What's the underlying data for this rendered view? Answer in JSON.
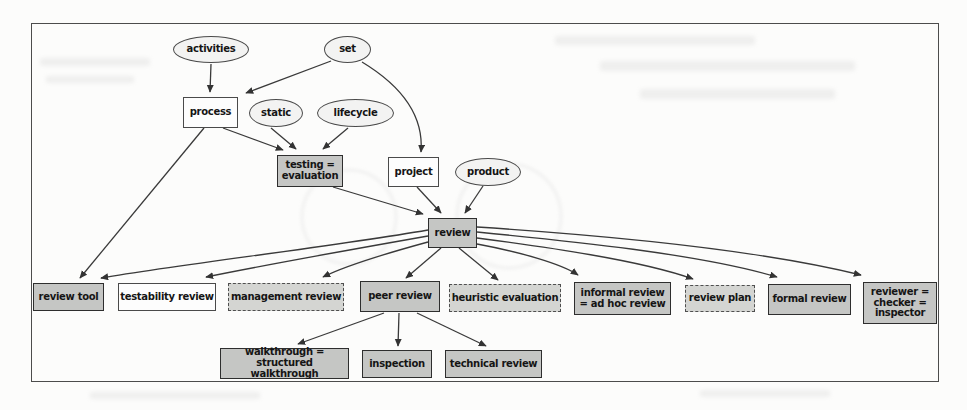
{
  "figure": {
    "colors": {
      "node_gray": "#c5c6c4",
      "node_gray_light": "#d4d5d2",
      "node_white": "#fdfdfd",
      "ellipse_fill": "#f3f3f2",
      "node_border": "#2e2e2e",
      "edge_line": "#3a3a3a"
    },
    "nodes": {
      "activities": {
        "label": "activities",
        "shape": "ellipse"
      },
      "set": {
        "label": "set",
        "shape": "ellipse"
      },
      "static": {
        "label": "static",
        "shape": "ellipse"
      },
      "lifecycle": {
        "label": "lifecycle",
        "shape": "ellipse"
      },
      "product": {
        "label": "product",
        "shape": "ellipse"
      },
      "process": {
        "label": "process",
        "shape": "rect-white"
      },
      "project": {
        "label": "project",
        "shape": "rect-white"
      },
      "testability_review": {
        "label": "testability review",
        "shape": "rect-white"
      },
      "testing_evaluation": {
        "label": "testing = evaluation",
        "shape": "rect-gray"
      },
      "review": {
        "label": "review",
        "shape": "rect-gray"
      },
      "review_tool": {
        "label": "review tool",
        "shape": "rect-gray"
      },
      "peer_review": {
        "label": "peer review",
        "shape": "rect-gray"
      },
      "informal_review": {
        "label": "informal review = ad hoc review",
        "shape": "rect-gray"
      },
      "formal_review": {
        "label": "formal review",
        "shape": "rect-gray"
      },
      "reviewer": {
        "label": "reviewer = checker = inspector",
        "shape": "rect-gray"
      },
      "walkthrough": {
        "label": "walkthrough = structured walkthrough",
        "shape": "rect-gray"
      },
      "inspection": {
        "label": "inspection",
        "shape": "rect-gray"
      },
      "technical_review": {
        "label": "technical review",
        "shape": "rect-gray"
      },
      "management_review": {
        "label": "management review",
        "shape": "rect-gray-dashed"
      },
      "heuristic_evaluation": {
        "label": "heuristic evaluation",
        "shape": "rect-gray-dashed"
      },
      "review_plan": {
        "label": "review plan",
        "shape": "rect-gray-dashed"
      }
    },
    "edges": [
      {
        "from": "activities",
        "to": "process"
      },
      {
        "from": "set",
        "to": "process"
      },
      {
        "from": "set",
        "to": "project"
      },
      {
        "from": "static",
        "to": "testing_evaluation"
      },
      {
        "from": "lifecycle",
        "to": "testing_evaluation"
      },
      {
        "from": "process",
        "to": "testing_evaluation"
      },
      {
        "from": "process",
        "to": "review_tool"
      },
      {
        "from": "testing_evaluation",
        "to": "review"
      },
      {
        "from": "project",
        "to": "review"
      },
      {
        "from": "product",
        "to": "review"
      },
      {
        "from": "review",
        "to": "review_tool"
      },
      {
        "from": "review",
        "to": "testability_review"
      },
      {
        "from": "review",
        "to": "management_review"
      },
      {
        "from": "review",
        "to": "peer_review"
      },
      {
        "from": "review",
        "to": "heuristic_evaluation"
      },
      {
        "from": "review",
        "to": "informal_review"
      },
      {
        "from": "review",
        "to": "review_plan"
      },
      {
        "from": "review",
        "to": "formal_review"
      },
      {
        "from": "review",
        "to": "reviewer"
      },
      {
        "from": "peer_review",
        "to": "walkthrough"
      },
      {
        "from": "peer_review",
        "to": "inspection"
      },
      {
        "from": "peer_review",
        "to": "technical_review"
      }
    ]
  }
}
